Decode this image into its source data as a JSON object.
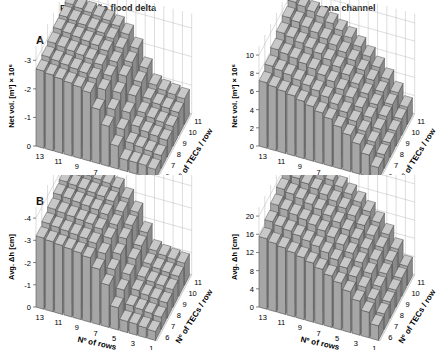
{
  "figure": {
    "columns": [
      "Faro-Olhão flood delta",
      "Armona channel"
    ],
    "rows": [
      "A",
      "B"
    ]
  },
  "chart_data": [
    {
      "type": "bar3d",
      "panel": "A",
      "title": "Faro-Olhão flood delta",
      "xlabel": "Nº of rows",
      "ylabel": "Net vol. [m³] × 10⁶",
      "zlabel": "Nº of TECs / row",
      "x_ticks": [
        "13",
        "11",
        "9",
        "7",
        "5",
        "3",
        "1"
      ],
      "depth_ticks": [
        "6",
        "7",
        "8",
        "9",
        "10",
        "11"
      ],
      "y_ticks": [
        "0",
        "-1",
        "-2",
        "-3"
      ],
      "ylim": [
        0,
        -3.5
      ],
      "x": [
        13,
        12,
        11,
        10,
        9,
        8,
        7,
        6,
        5,
        4,
        3,
        2,
        1
      ],
      "depth": [
        6,
        7,
        8,
        9,
        10,
        11
      ],
      "values": [
        [
          -2.7,
          -2.65,
          -2.6,
          -2.55,
          -2.5,
          -2.4,
          -1.9,
          -1.4,
          -0.8,
          -0.4,
          -0.4,
          -0.4,
          -0.35
        ],
        [
          -2.8,
          -2.75,
          -2.7,
          -2.65,
          -2.6,
          -2.5,
          -2.2,
          -1.6,
          -1.0,
          -0.6,
          -0.55,
          -0.5,
          -0.45
        ],
        [
          -2.9,
          -2.85,
          -2.8,
          -2.75,
          -2.7,
          -2.6,
          -2.3,
          -1.8,
          -1.2,
          -0.8,
          -0.7,
          -0.65,
          -0.6
        ],
        [
          -3.0,
          -2.95,
          -2.9,
          -2.85,
          -2.8,
          -2.7,
          -2.4,
          -2.0,
          -1.4,
          -0.9,
          -0.8,
          -0.75,
          -0.7
        ],
        [
          -3.05,
          -3.0,
          -2.95,
          -2.9,
          -2.85,
          -2.75,
          -2.5,
          -2.1,
          -1.5,
          -1.0,
          -0.9,
          -0.85,
          -0.8
        ],
        [
          -3.1,
          -3.05,
          -3.0,
          -2.95,
          -2.9,
          -2.8,
          -2.6,
          -2.2,
          -1.6,
          -1.1,
          -1.0,
          -0.95,
          -0.9
        ]
      ],
      "grid": true
    },
    {
      "type": "bar3d",
      "panel": "A",
      "title": "Armona channel",
      "xlabel": "Nº of rows",
      "ylabel": "Net vol. [m³] × 10⁶",
      "zlabel": "Nº of TECs / row",
      "x_ticks": [
        "13",
        "11",
        "9",
        "7",
        "5",
        "3",
        "1"
      ],
      "depth_ticks": [
        "6",
        "7",
        "8",
        "9",
        "10",
        "11"
      ],
      "y_ticks": [
        "0",
        "2",
        "4",
        "6",
        "8",
        "10"
      ],
      "ylim": [
        0,
        11
      ],
      "x": [
        13,
        12,
        11,
        10,
        9,
        8,
        7,
        6,
        5,
        4,
        3,
        2,
        1
      ],
      "depth": [
        6,
        7,
        8,
        9,
        10,
        11
      ],
      "values": [
        [
          7.2,
          7.0,
          6.8,
          6.6,
          6.3,
          6.0,
          5.6,
          5.2,
          4.6,
          4.0,
          3.3,
          2.4,
          1.3
        ],
        [
          7.8,
          7.6,
          7.4,
          7.1,
          6.8,
          6.5,
          6.1,
          5.6,
          5.0,
          4.3,
          3.5,
          2.6,
          1.5
        ],
        [
          8.4,
          8.2,
          8.0,
          7.7,
          7.4,
          7.0,
          6.6,
          6.0,
          5.4,
          4.6,
          3.8,
          2.8,
          1.6
        ],
        [
          9.0,
          8.8,
          8.5,
          8.2,
          7.9,
          7.5,
          7.0,
          6.4,
          5.7,
          4.9,
          4.0,
          3.0,
          1.7
        ],
        [
          9.5,
          9.3,
          9.0,
          8.7,
          8.3,
          7.9,
          7.4,
          6.8,
          6.0,
          5.2,
          4.2,
          3.1,
          1.8
        ],
        [
          10.0,
          9.8,
          9.5,
          9.2,
          8.8,
          8.3,
          7.8,
          7.1,
          6.3,
          5.4,
          4.4,
          3.2,
          1.9
        ]
      ],
      "grid": true
    },
    {
      "type": "bar3d",
      "panel": "B",
      "title": "Faro-Olhão flood delta",
      "xlabel": "Nº of rows",
      "ylabel": "Avg. Δh [cm]",
      "zlabel": "Nº of TECs / row",
      "x_ticks": [
        "13",
        "11",
        "9",
        "7",
        "5",
        "3",
        "1"
      ],
      "depth_ticks": [
        "6",
        "7",
        "8",
        "9",
        "10",
        "11"
      ],
      "y_ticks": [
        "0",
        "-1",
        "-2",
        "-3",
        "-4"
      ],
      "ylim": [
        0,
        -4.5
      ],
      "x": [
        13,
        12,
        11,
        10,
        9,
        8,
        7,
        6,
        5,
        4,
        3,
        2,
        1
      ],
      "depth": [
        6,
        7,
        8,
        9,
        10,
        11
      ],
      "values": [
        [
          -3.2,
          -3.15,
          -3.1,
          -3.05,
          -3.0,
          -2.9,
          -2.5,
          -1.9,
          -1.0,
          -0.5,
          -0.5,
          -0.45,
          -0.4
        ],
        [
          -3.35,
          -3.3,
          -3.25,
          -3.2,
          -3.15,
          -3.05,
          -2.7,
          -2.1,
          -1.3,
          -0.7,
          -0.65,
          -0.6,
          -0.55
        ],
        [
          -3.5,
          -3.45,
          -3.4,
          -3.35,
          -3.3,
          -3.2,
          -2.9,
          -2.3,
          -1.5,
          -0.9,
          -0.8,
          -0.75,
          -0.7
        ],
        [
          -3.65,
          -3.6,
          -3.55,
          -3.5,
          -3.45,
          -3.35,
          -3.0,
          -2.5,
          -1.7,
          -1.0,
          -0.9,
          -0.85,
          -0.8
        ],
        [
          -3.75,
          -3.7,
          -3.65,
          -3.6,
          -3.55,
          -3.45,
          -3.1,
          -2.6,
          -1.8,
          -1.1,
          -1.0,
          -0.95,
          -0.9
        ],
        [
          -3.85,
          -3.8,
          -3.75,
          -3.7,
          -3.65,
          -3.55,
          -3.2,
          -2.7,
          -1.9,
          -1.2,
          -1.1,
          -1.05,
          -1.0
        ]
      ],
      "grid": true
    },
    {
      "type": "bar3d",
      "panel": "B",
      "title": "Armona channel",
      "xlabel": "Nº of rows",
      "ylabel": "Avg. Δh [cm]",
      "zlabel": "Nº of TECs / row",
      "x_ticks": [
        "13",
        "11",
        "9",
        "7",
        "5",
        "3",
        "1"
      ],
      "depth_ticks": [
        "6",
        "7",
        "8",
        "9",
        "10",
        "11"
      ],
      "y_ticks": [
        "0",
        "4",
        "8",
        "12",
        "16",
        "20"
      ],
      "ylim": [
        0,
        22
      ],
      "x": [
        13,
        12,
        11,
        10,
        9,
        8,
        7,
        6,
        5,
        4,
        3,
        2,
        1
      ],
      "depth": [
        6,
        7,
        8,
        9,
        10,
        11
      ],
      "values": [
        [
          15.5,
          15.0,
          14.6,
          14.1,
          13.6,
          13.0,
          12.2,
          11.3,
          10.3,
          9.0,
          7.5,
          5.6,
          3.2
        ],
        [
          16.8,
          16.3,
          15.9,
          15.4,
          14.8,
          14.2,
          13.4,
          12.4,
          11.2,
          9.8,
          8.1,
          6.0,
          3.4
        ],
        [
          18.0,
          17.5,
          17.0,
          16.5,
          15.9,
          15.2,
          14.3,
          13.3,
          12.0,
          10.5,
          8.7,
          6.4,
          3.6
        ],
        [
          19.1,
          18.6,
          18.1,
          17.5,
          16.9,
          16.1,
          15.2,
          14.1,
          12.7,
          11.1,
          9.2,
          6.8,
          3.8
        ],
        [
          20.1,
          19.6,
          19.0,
          18.4,
          17.7,
          16.9,
          15.9,
          14.8,
          13.3,
          11.6,
          9.6,
          7.1,
          4.0
        ],
        [
          21.0,
          20.5,
          19.9,
          19.2,
          18.5,
          17.6,
          16.6,
          15.4,
          13.9,
          12.1,
          10.0,
          7.4,
          4.2
        ]
      ],
      "grid": true
    }
  ]
}
